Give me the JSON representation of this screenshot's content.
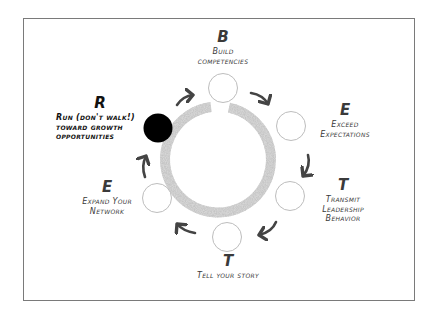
{
  "diagram": {
    "center_ring": {
      "color": "#d6d6d6",
      "gap": "top"
    },
    "colors": {
      "frame_border": "#7a7a7a",
      "node_outline": "#bdbdbd",
      "active_node_fill": "#000000",
      "arrow": "#444444",
      "text": "#3a3a3a"
    },
    "nodes": [
      {
        "id": "R",
        "letter": "R",
        "text": "Run (don't walk!)\ntoward growth\nopportunities",
        "active": true
      },
      {
        "id": "B",
        "letter": "B",
        "text": "Build\ncompetencies",
        "active": false
      },
      {
        "id": "E1",
        "letter": "E",
        "text": "Exceed\nExpectations",
        "active": false
      },
      {
        "id": "T1",
        "letter": "T",
        "text": "Transmit\nLeadership\nBehavior",
        "active": false
      },
      {
        "id": "T2",
        "letter": "T",
        "text": "Tell your story",
        "active": false
      },
      {
        "id": "E2",
        "letter": "E",
        "text": "Expand Your\nNetwork",
        "active": false
      }
    ],
    "flow": [
      "R",
      "B",
      "E1",
      "T1",
      "T2",
      "E2",
      "R"
    ],
    "direction": "clockwise"
  }
}
